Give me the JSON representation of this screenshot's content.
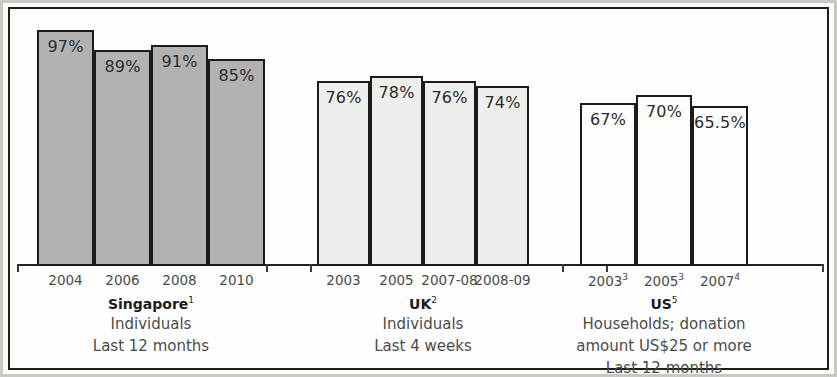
{
  "chart_data": {
    "type": "bar",
    "title": "",
    "subtitle": "",
    "xlabel": "",
    "ylabel": "",
    "ylim": [
      0,
      100
    ],
    "grid": false,
    "legend_position": "none",
    "value_suffix": "%",
    "groups": [
      {
        "name": "Singapore",
        "name_superscript": "1",
        "description_lines": [
          "Individuals",
          "Last 12 months"
        ],
        "fill_color": "#b2b2b2",
        "categories": [
          "2004",
          "2006",
          "2008",
          "2010"
        ],
        "category_superscripts": [
          "",
          "",
          "",
          ""
        ],
        "values": [
          97,
          89,
          91,
          85
        ],
        "value_labels": [
          "97%",
          "89%",
          "91%",
          "85%"
        ]
      },
      {
        "name": "UK",
        "name_superscript": "2",
        "description_lines": [
          "Individuals",
          "Last 4 weeks"
        ],
        "fill_color": "#eeeeec",
        "categories": [
          "2003",
          "2005",
          "2007-08",
          "2008-09"
        ],
        "category_superscripts": [
          "",
          "",
          "",
          ""
        ],
        "values": [
          76,
          78,
          76,
          74
        ],
        "value_labels": [
          "76%",
          "78%",
          "76%",
          "74%"
        ]
      },
      {
        "name": "US",
        "name_superscript": "5",
        "description_lines": [
          "Households; donation",
          "amount US$25 or more",
          "Last 12 months"
        ],
        "fill_color": "#fdfdfb",
        "categories": [
          "2003",
          "2005",
          "2007"
        ],
        "category_superscripts": [
          "3",
          "3",
          "4"
        ],
        "values": [
          67,
          70,
          65.5
        ],
        "value_labels": [
          "67%",
          "70%",
          "65.5%"
        ]
      }
    ]
  },
  "colors": {
    "frame": "#1d1d1d",
    "axis": "#242424",
    "bar_outline": "#1b1b1b",
    "label_text": "#4a4a4a",
    "value_text": "#2b2b2b"
  }
}
